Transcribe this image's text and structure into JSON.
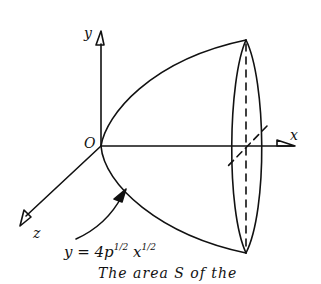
{
  "diagram": {
    "axes": {
      "x_label": "x",
      "y_label": "y",
      "z_label": "z",
      "origin_label": "O"
    },
    "curve_equation": {
      "lhs": "y = 4p",
      "exp1": "1/2",
      "var": "x",
      "exp2": "1/2"
    },
    "caption": "The area S of the",
    "colors": {
      "stroke": "#111111",
      "background": "#ffffff"
    }
  }
}
